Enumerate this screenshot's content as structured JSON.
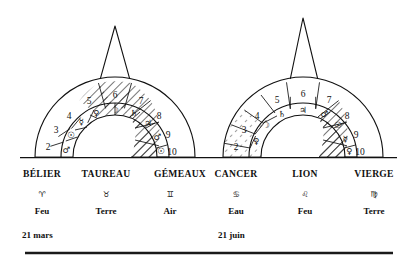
{
  "figure": {
    "background_color": "#ffffff",
    "ink_color": "#111111"
  },
  "arches": [
    {
      "name": "left-arch",
      "spire": "triangular",
      "outer_ring_numbers": [
        "2",
        "3",
        "4",
        "5",
        "6",
        "7",
        "8",
        "9",
        "10"
      ],
      "inner_ring_symbols": [
        "♂",
        "☉",
        "☿",
        "♀",
        "☽",
        "♄",
        "♃",
        "♂",
        "☉"
      ],
      "hatched_numbers": [
        "5",
        "6",
        "7",
        "8",
        "9",
        "10"
      ],
      "hatch_style": "bold-diagonal"
    },
    {
      "name": "right-arch",
      "spire": "triangular",
      "outer_ring_numbers": [
        "2",
        "3",
        "4",
        "5",
        "6",
        "7",
        "8",
        "9",
        "10"
      ],
      "inner_ring_symbols": [
        "♀",
        "☽",
        "♄",
        "♃",
        "♂",
        "☉",
        "☿",
        "♀"
      ],
      "hatched_numbers": [
        "2",
        "3",
        "4",
        "8",
        "9",
        "10"
      ],
      "hatch_style": "mixed-fine-and-bold"
    }
  ],
  "signs": [
    {
      "name": "BÉLIER",
      "glyph": "♈",
      "element": "Feu"
    },
    {
      "name": "TAUREAU",
      "glyph": "♉",
      "element": "Terre"
    },
    {
      "name": "GÉMEAUX",
      "glyph": "♊",
      "element": "Air"
    },
    {
      "name": "CANCER",
      "glyph": "♋",
      "element": "Eau"
    },
    {
      "name": "LION",
      "glyph": "♌",
      "element": "Feu"
    },
    {
      "name": "VIERGE",
      "glyph": "♍",
      "element": "Terre"
    }
  ],
  "dates": [
    {
      "label": "21 mars"
    },
    {
      "label": "21 juin"
    }
  ]
}
